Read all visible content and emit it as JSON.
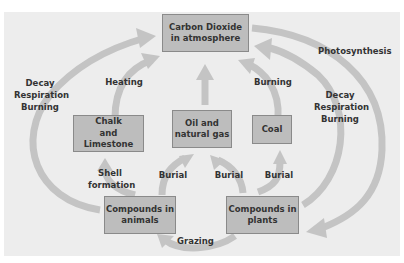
{
  "colors": {
    "background": "#ededed",
    "box_fill": "#bdbdbd",
    "box_border": "#8a8a8a",
    "arrow": "#c4c4c4",
    "text": "#333333"
  },
  "boxes": {
    "co2": "Carbon Dioxide\nin atmosphere",
    "chalk": "Chalk\nand Limestone",
    "oil": "Oil and\nnatural gas",
    "coal": "Coal",
    "animals": "Compounds in\nanimals",
    "plants": "Compounds in\nplants"
  },
  "labels": {
    "decay_left": "Decay\nRespiration\nBurning",
    "heating": "Heating",
    "burning_coal": "Burning",
    "photosynthesis": "Photosynthesis",
    "decay_right": "Decay\nRespiration\nBurning",
    "shell_formation": "Shell\nformation",
    "burial_animals": "Burial",
    "burial_plants_oil": "Burial",
    "burial_plants_coal": "Burial",
    "grazing": "Grazing"
  }
}
